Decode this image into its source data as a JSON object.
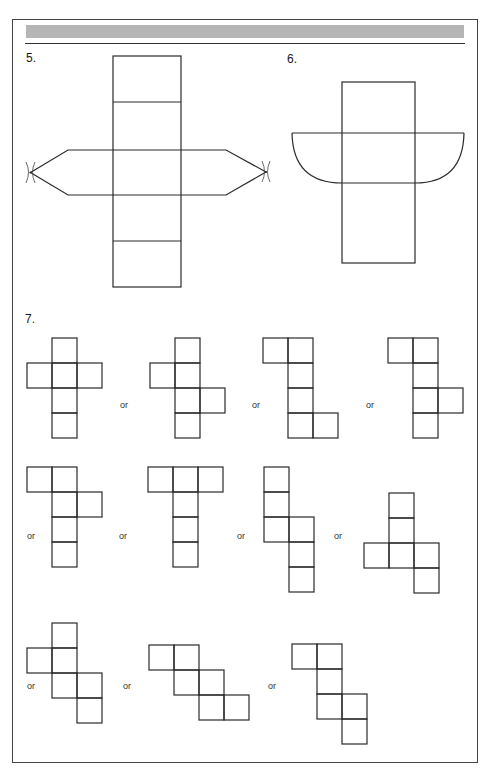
{
  "header": {
    "banner_color": "#b5b5b5"
  },
  "problems": [
    {
      "number": "5.",
      "description": "Net of hexagonal-ended prism (cross shape with pointed side flaps)"
    },
    {
      "number": "6.",
      "description": "Net of half-cylinder (rectangles with semicircular side flaps)"
    },
    {
      "number": "7.",
      "description": "Cube nets"
    }
  ],
  "connector_word": "or",
  "cube_nets": [
    {
      "id": "a",
      "cells": [
        [
          1,
          0
        ],
        [
          0,
          1
        ],
        [
          1,
          1
        ],
        [
          2,
          1
        ],
        [
          1,
          2
        ],
        [
          1,
          3
        ]
      ]
    },
    {
      "id": "b",
      "cells": [
        [
          1,
          0
        ],
        [
          0,
          1
        ],
        [
          1,
          1
        ],
        [
          1,
          2
        ],
        [
          2,
          2
        ],
        [
          1,
          3
        ]
      ]
    },
    {
      "id": "c",
      "cells": [
        [
          0,
          0
        ],
        [
          1,
          0
        ],
        [
          1,
          1
        ],
        [
          1,
          2
        ],
        [
          1,
          3
        ],
        [
          2,
          3
        ]
      ]
    },
    {
      "id": "d",
      "cells": [
        [
          0,
          0
        ],
        [
          1,
          0
        ],
        [
          1,
          1
        ],
        [
          1,
          2
        ],
        [
          2,
          2
        ],
        [
          1,
          3
        ]
      ]
    },
    {
      "id": "e",
      "cells": [
        [
          0,
          0
        ],
        [
          1,
          0
        ],
        [
          1,
          1
        ],
        [
          2,
          1
        ],
        [
          1,
          2
        ],
        [
          1,
          3
        ]
      ]
    },
    {
      "id": "f",
      "cells": [
        [
          0,
          0
        ],
        [
          1,
          0
        ],
        [
          2,
          0
        ],
        [
          1,
          1
        ],
        [
          1,
          2
        ],
        [
          1,
          3
        ]
      ]
    },
    {
      "id": "g",
      "cells": [
        [
          0,
          0
        ],
        [
          0,
          1
        ],
        [
          0,
          2
        ],
        [
          1,
          2
        ],
        [
          1,
          3
        ],
        [
          1,
          4
        ]
      ]
    },
    {
      "id": "h",
      "cells": [
        [
          1,
          1
        ],
        [
          1,
          2
        ],
        [
          0,
          3
        ],
        [
          1,
          3
        ],
        [
          2,
          3
        ],
        [
          2,
          4
        ]
      ]
    },
    {
      "id": "i",
      "cells": [
        [
          1,
          0
        ],
        [
          0,
          1
        ],
        [
          1,
          1
        ],
        [
          1,
          2
        ],
        [
          2,
          2
        ],
        [
          2,
          3
        ]
      ]
    },
    {
      "id": "j",
      "cells": [
        [
          0,
          0
        ],
        [
          1,
          0
        ],
        [
          1,
          1
        ],
        [
          2,
          1
        ],
        [
          2,
          2
        ],
        [
          3,
          2
        ]
      ]
    },
    {
      "id": "k",
      "cells": [
        [
          0,
          0
        ],
        [
          1,
          0
        ],
        [
          1,
          1
        ],
        [
          1,
          2
        ],
        [
          2,
          2
        ],
        [
          2,
          3
        ]
      ]
    }
  ]
}
